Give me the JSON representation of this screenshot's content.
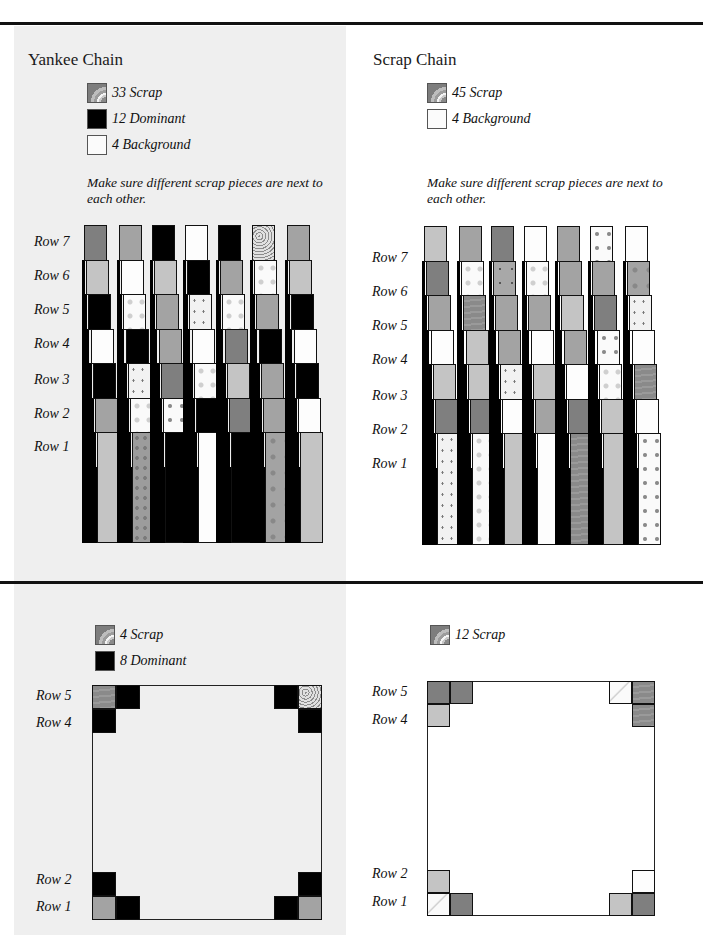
{
  "top_left": {
    "title": "Yankee Chain",
    "legend": [
      {
        "swatch": "scrap",
        "label": "33 Scrap"
      },
      {
        "swatch": "dominant",
        "label": "12 Dominant"
      },
      {
        "swatch": "background",
        "label": "4 Background"
      }
    ],
    "note": "Make sure different scrap pieces are next to each other.",
    "row_labels": [
      "Row 7",
      "Row 6",
      "Row 5",
      "Row 4",
      "Row 3",
      "Row 2",
      "Row 1"
    ],
    "columns": [
      [
        "dark",
        "light",
        "dom",
        "bg",
        "dom",
        "mid",
        "light"
      ],
      [
        "mid",
        "bg",
        "flower",
        "dom",
        "dot",
        "flower",
        "speck"
      ],
      [
        "dom",
        "light",
        "mid",
        "mid",
        "dark",
        "flowerdk",
        "dom"
      ],
      [
        "bg",
        "dom",
        "dot",
        "bg",
        "flower",
        "dom",
        "bg"
      ],
      [
        "dom",
        "mid",
        "flower",
        "dark",
        "light",
        "dark",
        "dom"
      ],
      [
        "swirl",
        "flower",
        "mid",
        "dom",
        "mid",
        "mid",
        "mdflower"
      ],
      [
        "mid",
        "light",
        "dom",
        "bg",
        "dom",
        "bg",
        "light"
      ]
    ]
  },
  "top_right": {
    "title": "Scrap Chain",
    "legend": [
      {
        "swatch": "scrap",
        "label": "45 Scrap"
      },
      {
        "swatch": "background",
        "label": "4 Background"
      }
    ],
    "note": "Make sure different scrap pieces are next to each other.",
    "row_labels": [
      "Row 7",
      "Row 6",
      "Row 5",
      "Row 4",
      "Row 3",
      "Row 2",
      "Row 1"
    ],
    "columns": [
      [
        "light",
        "dark",
        "mid",
        "bg",
        "light",
        "dark",
        "dot"
      ],
      [
        "mid",
        "flower",
        "wood",
        "light",
        "light",
        "dark",
        "flower"
      ],
      [
        "dark",
        "mddot",
        "mid",
        "mid",
        "dot",
        "bg",
        "light"
      ],
      [
        "bg",
        "flower",
        "mid",
        "bg",
        "light",
        "mid",
        "bg"
      ],
      [
        "mid",
        "mid",
        "light",
        "mid",
        "bg",
        "dark",
        "wood"
      ],
      [
        "flowerdk",
        "mid",
        "dark",
        "flowerdk",
        "flower",
        "light",
        "light"
      ],
      [
        "bg",
        "mdflower",
        "dot",
        "bg",
        "wood",
        "bg",
        "flowerdk"
      ]
    ]
  },
  "bottom_left": {
    "legend": [
      {
        "swatch": "scrap",
        "label": "4 Scrap"
      },
      {
        "swatch": "dominant",
        "label": "8 Dominant"
      }
    ],
    "row_labels": [
      "Row 5",
      "Row 4",
      "Row 2",
      "Row 1"
    ],
    "corners": {
      "row5": [
        "wood",
        "dom",
        "dom",
        "swirl"
      ],
      "row4": [
        "dom",
        "dom"
      ],
      "row2": [
        "dom",
        "dom"
      ],
      "row1": [
        "mid",
        "dom",
        "dom",
        "mid"
      ]
    }
  },
  "bottom_right": {
    "legend": [
      {
        "swatch": "scrap",
        "label": "12 Scrap"
      }
    ],
    "row_labels": [
      "Row 5",
      "Row 4",
      "Row 2",
      "Row 1"
    ],
    "corners": {
      "row5": [
        "dark",
        "dark",
        "leaf",
        "wood"
      ],
      "row4": [
        "light",
        "wood"
      ],
      "row2": [
        "light",
        "bg"
      ],
      "row1": [
        "leaf",
        "dark",
        "light",
        "dark"
      ]
    }
  }
}
